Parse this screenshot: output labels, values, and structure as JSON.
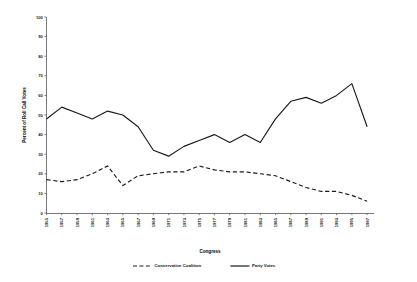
{
  "chart_data": {
    "type": "line",
    "title": "",
    "xlabel": "Congress",
    "ylabel": "Percent of Roll Call Votes",
    "ylim": [
      0,
      100
    ],
    "ytick_step": 10,
    "yticks": [
      0,
      10,
      20,
      30,
      40,
      50,
      60,
      70,
      80,
      90,
      100
    ],
    "grid": false,
    "legend_position": "bottom",
    "categories": [
      "1955",
      "1957",
      "1959",
      "1961",
      "1963",
      "1965",
      "1967",
      "1969",
      "1971",
      "1973",
      "1975",
      "1977",
      "1979",
      "1981",
      "1983",
      "1985",
      "1987",
      "1989",
      "1991",
      "1993",
      "1995",
      "1997"
    ],
    "series": [
      {
        "name": "Conservative Coalition",
        "style": "dashed",
        "color": "#1a1a1a",
        "values": [
          17,
          16,
          17,
          20,
          24,
          14,
          19,
          20,
          21,
          21,
          24,
          22,
          21,
          21,
          20,
          19,
          16,
          13,
          11,
          11,
          9,
          6
        ]
      },
      {
        "name": "Party Votes",
        "style": "solid",
        "color": "#1a1a1a",
        "values": [
          48,
          54,
          51,
          48,
          52,
          50,
          44,
          32,
          29,
          34,
          37,
          40,
          36,
          40,
          36,
          48,
          57,
          59,
          56,
          60,
          66,
          44
        ]
      }
    ]
  },
  "legend": {
    "entries": [
      {
        "label": "Conservative Coalition",
        "style": "dashed"
      },
      {
        "label": "Party Votes",
        "style": "solid"
      }
    ]
  }
}
